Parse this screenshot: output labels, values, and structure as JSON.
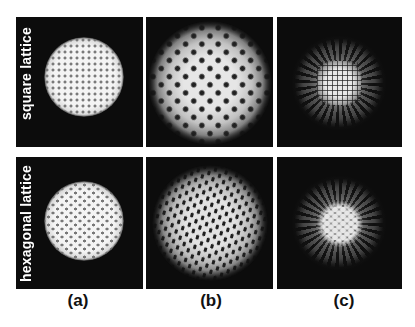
{
  "figure": {
    "rows": [
      {
        "label": "square lattice"
      },
      {
        "label": "hexagonal lattice"
      }
    ],
    "columns": [
      {
        "label": "(a)"
      },
      {
        "label": "(b)"
      },
      {
        "label": "(c)"
      }
    ],
    "panel_background": "#0c0c0c",
    "page_background": "#ffffff"
  }
}
